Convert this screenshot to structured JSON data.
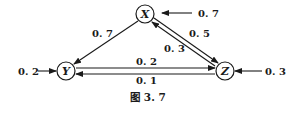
{
  "nodes": {
    "x": {
      "label": "X"
    },
    "y": {
      "label": "Y"
    },
    "z": {
      "label": "Z"
    }
  },
  "edges": {
    "ext_to_x": "0. 7",
    "x_to_y": "0. 7",
    "x_to_z": "0. 5",
    "z_to_x": "0. 3",
    "y_to_z": "0. 2",
    "z_to_y": "0. 1",
    "ext_to_y": "0. 2",
    "ext_to_z": "0. 3"
  },
  "caption": "图 3. 7",
  "colors": {
    "ink": "#1a1a1a",
    "background": "#ffffff"
  }
}
